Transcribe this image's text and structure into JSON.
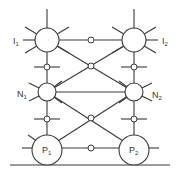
{
  "diagram": {
    "labels": {
      "I1": {
        "main": "I",
        "sub": "1"
      },
      "I2": {
        "main": "I",
        "sub": "2"
      },
      "N1": {
        "main": "N",
        "sub": "1"
      },
      "N2": {
        "main": "N",
        "sub": "2"
      },
      "P1": {
        "main": "P",
        "sub": "1"
      },
      "P2": {
        "main": "P",
        "sub": "2"
      }
    },
    "colors": {
      "stroke": "#3a3a3a",
      "background": "#ffffff"
    }
  }
}
